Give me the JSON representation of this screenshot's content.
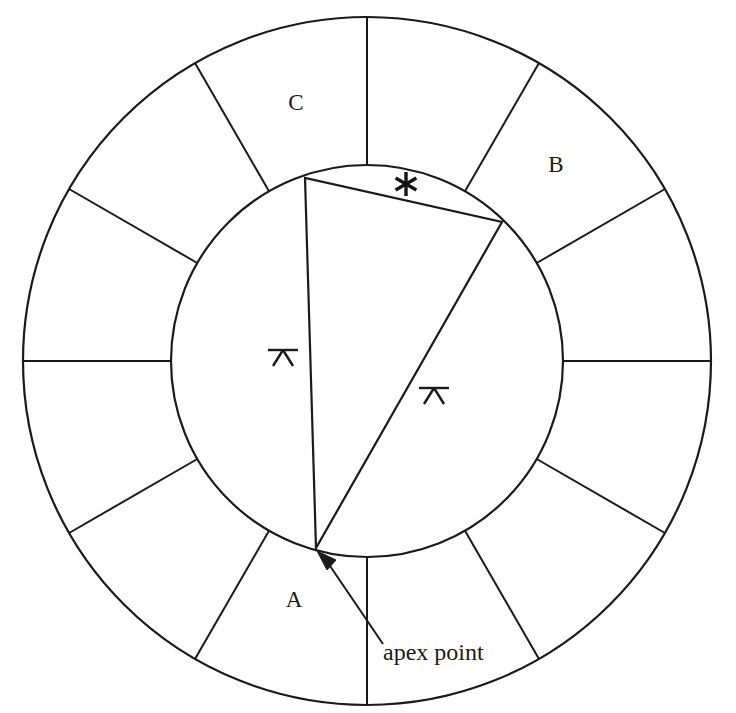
{
  "figure": {
    "background_color": "#ffffff",
    "line_color": "#1a1a1a",
    "center": {
      "x": 367,
      "y": 361
    },
    "inner_radius": 196,
    "outer_radius": 344,
    "sector_count": 12,
    "sector_step_degrees": 30,
    "first_spoke_angle_degrees": 90
  },
  "labels": {
    "region_a": "A",
    "region_b": "B",
    "region_c": "C",
    "apex_callout": "apex point",
    "asterisk": "*"
  },
  "label_positions": {
    "region_a": {
      "x": 294,
      "y": 607
    },
    "region_b": {
      "x": 556,
      "y": 172
    },
    "region_c": {
      "x": 296,
      "y": 110
    },
    "apex_callout": {
      "x": 383,
      "y": 660
    },
    "asterisk": {
      "x": 406,
      "y": 184
    }
  },
  "triangle": {
    "name": "inscribed triangle",
    "vertices": [
      {
        "name": "apex point",
        "x": 316,
        "y": 548
      },
      {
        "name": "upper left vertex",
        "x": 305,
        "y": 178
      },
      {
        "name": "right vertex",
        "x": 502,
        "y": 222
      }
    ],
    "tick_marked_sides": [
      {
        "name": "left side tick",
        "x": 283,
        "y": 355
      },
      {
        "name": "right side tick",
        "x": 434,
        "y": 393
      }
    ]
  },
  "callout": {
    "arrow_from": {
      "x": 383,
      "y": 644
    },
    "arrow_to": {
      "x": 321,
      "y": 556
    }
  }
}
